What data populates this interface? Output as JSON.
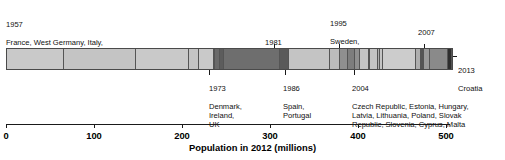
{
  "chart_data": {
    "type": "bar",
    "orientation": "horizontal-stacked",
    "title": "",
    "xlabel": "Population in 2012 (millions)",
    "ylabel": "",
    "xlim": [
      0,
      505
    ],
    "xticks": [
      0,
      100,
      200,
      300,
      400,
      500
    ],
    "xticklabels": [
      "0",
      "100",
      "200",
      "300",
      "400",
      "500"
    ],
    "grid": false,
    "legend": "none",
    "value_unit": "millions",
    "total": 505,
    "categories": [
      "1957 France, West Germany, Italy, Belgium, Netherlands, Luxembourg",
      "1973 Denmark, Ireland, UK",
      "1981 Greece",
      "1986 Spain, Portugal",
      "1995 Sweden, Austria, Finland",
      "2004 Czech Republic, Estonia, Hungary, Latvia, Lithuania, Poland, Slovak Republic, Slovenia, Cyprus, Malta",
      "2007 Bulgaria, Romania",
      "2013 Croatia"
    ],
    "values": [
      228,
      70,
      11,
      57,
      19,
      74,
      29,
      4
    ],
    "cumulative": [
      228,
      298,
      309,
      366,
      385,
      459,
      488,
      492
    ],
    "segments": [
      {
        "year": "1957",
        "country": "France",
        "value": 65,
        "shade": "#c9c9c9"
      },
      {
        "year": "1957",
        "country": "West Germany",
        "value": 82,
        "shade": "#c4c4c4"
      },
      {
        "year": "1957",
        "country": "Italy",
        "value": 60,
        "shade": "#c9c9c9"
      },
      {
        "year": "1957",
        "country": "Belgium",
        "value": 11,
        "shade": "#c4c4c4"
      },
      {
        "year": "1957",
        "country": "Netherlands",
        "value": 17,
        "shade": "#c9c9c9"
      },
      {
        "year": "1957",
        "country": "Luxembourg",
        "value": 1,
        "shade": "#c4c4c4"
      },
      {
        "year": "1973",
        "country": "Denmark",
        "value": 6,
        "shade": "#6a6a6a"
      },
      {
        "year": "1973",
        "country": "Ireland",
        "value": 5,
        "shade": "#5c5c5c"
      },
      {
        "year": "1973",
        "country": "UK",
        "value": 63,
        "shade": "#6e6e6e"
      },
      {
        "year": "1981",
        "country": "Greece",
        "value": 11,
        "shade": "#5a5a5a"
      },
      {
        "year": "1986",
        "country": "Spain",
        "value": 46,
        "shade": "#c4c4c4"
      },
      {
        "year": "1986",
        "country": "Portugal",
        "value": 11,
        "shade": "#bcbcbc"
      },
      {
        "year": "1995",
        "country": "Sweden",
        "value": 10,
        "shade": "#8f8f8f"
      },
      {
        "year": "1995",
        "country": "Austria",
        "value": 8,
        "shade": "#7d7d7d"
      },
      {
        "year": "1995",
        "country": "Finland",
        "value": 5,
        "shade": "#8f8f8f"
      },
      {
        "year": "2004",
        "country": "Czech Republic",
        "value": 10,
        "shade": "#c4c4c4"
      },
      {
        "year": "2004",
        "country": "Estonia",
        "value": 1,
        "shade": "#aeaeae"
      },
      {
        "year": "2004",
        "country": "Hungary",
        "value": 10,
        "shade": "#c4c4c4"
      },
      {
        "year": "2004",
        "country": "Latvia",
        "value": 2,
        "shade": "#aeaeae"
      },
      {
        "year": "2004",
        "country": "Lithuania",
        "value": 3,
        "shade": "#c4c4c4"
      },
      {
        "year": "2004",
        "country": "Poland",
        "value": 38,
        "shade": "#cccccc"
      },
      {
        "year": "2004",
        "country": "Slovak Republic",
        "value": 5,
        "shade": "#aeaeae"
      },
      {
        "year": "2004",
        "country": "Slovenia",
        "value": 2,
        "shade": "#c4c4c4"
      },
      {
        "year": "2004",
        "country": "Cyprus",
        "value": 1,
        "shade": "#aeaeae"
      },
      {
        "year": "2004",
        "country": "Malta",
        "value": 0.4,
        "shade": "#c4c4c4"
      },
      {
        "year": "2007",
        "country": "Bulgaria",
        "value": 7,
        "shade": "#9a9a9a"
      },
      {
        "year": "2007",
        "country": "Romania",
        "value": 21,
        "shade": "#8a8a8a"
      },
      {
        "year": "2013",
        "country": "Croatia",
        "value": 4,
        "shade": "#2e2e2e"
      }
    ]
  },
  "annotations": {
    "a1957": {
      "year": "1957",
      "members": "France, West Germany, Italy,\nBelgium, Netherlands, Luxembourg"
    },
    "a1973": {
      "year": "1973",
      "members": "Denmark,\nIreland,\nUK"
    },
    "a1981": {
      "year": "1981",
      "members": "Greece"
    },
    "a1986": {
      "year": "1986",
      "members": "Spain,\nPortugal"
    },
    "a1995": {
      "year": "1995",
      "members": "Sweden,\nAustria,\nFinland"
    },
    "a2004": {
      "year": "2004",
      "members": "Czech Republic, Estonia, Hungary,\nLatvia, Lithuania, Poland, Slovak\nRepublic, Slovenia, Cyprus, Malta"
    },
    "a2007": {
      "year": "2007",
      "members": "Bulgaria\nRomania"
    },
    "a2013": {
      "year": "2013",
      "members": "Croatia"
    }
  },
  "axis": {
    "label": "Population in 2012 (millions)",
    "ticks": [
      "0",
      "100",
      "200",
      "300",
      "400",
      "500"
    ]
  }
}
